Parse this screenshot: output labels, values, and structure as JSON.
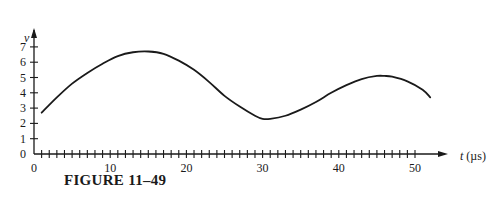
{
  "figure": {
    "caption": "FIGURE 11–49"
  },
  "chart_data": {
    "type": "line",
    "title": "",
    "xlabel": "t (µs)",
    "ylabel": "v",
    "x_ticks": [
      0,
      10,
      20,
      30,
      40,
      50
    ],
    "x_minor_tick_step": 1,
    "y_ticks": [
      0,
      1,
      2,
      3,
      4,
      5,
      6,
      7
    ],
    "xlim": [
      0,
      55
    ],
    "ylim": [
      0,
      8
    ],
    "grid": false,
    "legend": null,
    "series": [
      {
        "name": "v(t)",
        "x": [
          1,
          3,
          5,
          7,
          9,
          11,
          13,
          15,
          17,
          19,
          21,
          23,
          25,
          27,
          29,
          30,
          31,
          33,
          35,
          37,
          39,
          41,
          43,
          45,
          46,
          47,
          49,
          51,
          52
        ],
        "values": [
          2.7,
          3.7,
          4.6,
          5.3,
          5.9,
          6.4,
          6.65,
          6.7,
          6.55,
          6.1,
          5.5,
          4.7,
          3.8,
          3.1,
          2.5,
          2.3,
          2.3,
          2.5,
          2.9,
          3.4,
          4.0,
          4.5,
          4.9,
          5.1,
          5.1,
          5.05,
          4.75,
          4.2,
          3.7
        ]
      }
    ]
  }
}
